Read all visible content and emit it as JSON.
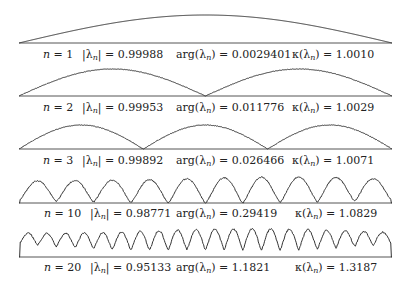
{
  "figure": {
    "line_color": "#333333",
    "baseline_color": "#555555",
    "x_start": 19,
    "x_end": 392
  },
  "chart_data": {
    "type": "line",
    "title": "",
    "xlabel": "",
    "ylabel": "",
    "grid": false,
    "legend": "none",
    "panels": [
      {
        "n": 1,
        "abs_lambda": "0.99988",
        "arg_lambda": "0.0029401",
        "kappa_lambda": "1.0010",
        "arches": 1,
        "baseline_y": 43,
        "peak_y": 15,
        "label_y": 49,
        "noise": 0.0
      },
      {
        "n": 2,
        "abs_lambda": "0.99953",
        "arg_lambda": "0.011776",
        "kappa_lambda": "1.0029",
        "arches": 2,
        "baseline_y": 96,
        "peak_y": 69,
        "label_y": 102,
        "noise": 0.5
      },
      {
        "n": 3,
        "abs_lambda": "0.99892",
        "arg_lambda": "0.026466",
        "kappa_lambda": "1.0071",
        "arches": 3,
        "baseline_y": 149,
        "peak_y": 125,
        "label_y": 155,
        "noise": 0.6
      },
      {
        "n": 10,
        "abs_lambda": "0.98771",
        "arg_lambda": "0.29419",
        "kappa_lambda": "1.0829",
        "arches": 10,
        "baseline_y": 203,
        "peak_y": 177,
        "label_y": 208,
        "noise": 1.2
      },
      {
        "n": 20,
        "abs_lambda": "0.95133",
        "arg_lambda": "1.1821",
        "kappa_lambda": "1.3187",
        "arches": 20,
        "baseline_y": 257,
        "peak_y": 230,
        "label_y": 262,
        "noise": 1.6
      }
    ]
  },
  "labels": {
    "n_prefix": "n = ",
    "abs_prefix_open": "|λ",
    "abs_sub": "n",
    "abs_suffix": "| = ",
    "arg_prefix": "arg(λ",
    "arg_sub": "n",
    "arg_suffix": ") = ",
    "kappa_prefix": "κ(λ",
    "kappa_sub": "n",
    "kappa_suffix": ") = "
  },
  "rows": [
    {
      "n": "1",
      "abs": "0.99988",
      "arg": "0.0029401",
      "kappa": "1.0010"
    },
    {
      "n": "2",
      "abs": "0.99953",
      "arg": "0.011776",
      "kappa": "1.0029"
    },
    {
      "n": "3",
      "abs": "0.99892",
      "arg": "0.026466",
      "kappa": "1.0071"
    },
    {
      "n": "10",
      "abs": "0.98771",
      "arg": "0.29419",
      "kappa": "1.0829"
    },
    {
      "n": "20",
      "abs": "0.95133",
      "arg": "1.1821",
      "kappa": "1.3187"
    }
  ]
}
